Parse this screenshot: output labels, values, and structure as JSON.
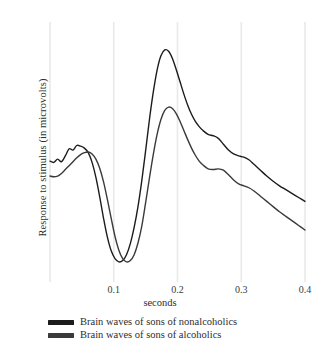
{
  "chart_data": {
    "type": "line",
    "title": "",
    "subtitle": "",
    "xlabel": "seconds",
    "ylabel": "Response to stimulus (in microvolts)",
    "xlim": [
      0.0,
      0.4
    ],
    "ylim": [
      -6,
      14
    ],
    "xticks": [
      0.1,
      0.2,
      0.3,
      0.4
    ],
    "xtick_labels": [
      "0.1",
      "0.2",
      "0.3",
      "0.4"
    ],
    "yticks": [],
    "ytick_labels": [],
    "grid": "vertical-only",
    "grid_color": "#e9e9e9",
    "legend_position": "below-plot-left",
    "annotations": [],
    "series": [
      {
        "name": "Brain waves of sons of nonalcoholics",
        "color": "#1c1c1c",
        "linewidth": 1.4,
        "x": [
          0.0,
          0.006,
          0.012,
          0.018,
          0.024,
          0.03,
          0.036,
          0.042,
          0.048,
          0.054,
          0.06,
          0.066,
          0.072,
          0.078,
          0.084,
          0.09,
          0.096,
          0.102,
          0.108,
          0.114,
          0.12,
          0.126,
          0.132,
          0.138,
          0.144,
          0.15,
          0.156,
          0.162,
          0.168,
          0.174,
          0.18,
          0.186,
          0.192,
          0.198,
          0.204,
          0.21,
          0.216,
          0.222,
          0.228,
          0.234,
          0.24,
          0.248,
          0.256,
          0.264,
          0.272,
          0.28,
          0.288,
          0.296,
          0.304,
          0.312,
          0.32,
          0.33,
          0.34,
          0.35,
          0.36,
          0.37,
          0.38,
          0.39,
          0.4
        ],
        "y": [
          3.3,
          3.2,
          3.45,
          3.25,
          3.7,
          4.25,
          4.15,
          4.5,
          4.45,
          4.3,
          3.95,
          3.2,
          2.05,
          0.55,
          -1.1,
          -2.55,
          -3.6,
          -4.2,
          -4.45,
          -4.35,
          -3.9,
          -3.05,
          -1.8,
          -0.2,
          1.8,
          4.1,
          6.5,
          8.6,
          10.3,
          11.4,
          11.85,
          11.75,
          11.2,
          10.35,
          9.4,
          8.45,
          7.6,
          6.9,
          6.35,
          5.95,
          5.65,
          5.35,
          5.25,
          5.05,
          4.6,
          4.15,
          3.85,
          3.7,
          3.6,
          3.4,
          3.05,
          2.6,
          2.15,
          1.75,
          1.4,
          1.1,
          0.8,
          0.5,
          0.2
        ]
      },
      {
        "name": "Brain waves of sons of alcoholics",
        "color": "#3a3a3a",
        "linewidth": 1.4,
        "x": [
          0.0,
          0.006,
          0.012,
          0.018,
          0.024,
          0.03,
          0.036,
          0.042,
          0.048,
          0.054,
          0.06,
          0.066,
          0.072,
          0.078,
          0.084,
          0.09,
          0.096,
          0.102,
          0.108,
          0.114,
          0.12,
          0.126,
          0.132,
          0.138,
          0.144,
          0.15,
          0.156,
          0.162,
          0.168,
          0.174,
          0.18,
          0.186,
          0.192,
          0.198,
          0.204,
          0.21,
          0.216,
          0.222,
          0.228,
          0.234,
          0.24,
          0.248,
          0.256,
          0.264,
          0.272,
          0.28,
          0.288,
          0.296,
          0.304,
          0.312,
          0.32,
          0.33,
          0.34,
          0.35,
          0.36,
          0.37,
          0.38,
          0.39,
          0.4
        ],
        "y": [
          2.15,
          2.1,
          2.15,
          2.35,
          2.65,
          2.95,
          3.25,
          3.55,
          3.8,
          3.95,
          4.0,
          3.85,
          3.45,
          2.75,
          1.7,
          0.35,
          -1.1,
          -2.5,
          -3.55,
          -4.2,
          -4.45,
          -4.35,
          -3.9,
          -3.0,
          -1.7,
          0.1,
          2.0,
          3.8,
          5.35,
          6.5,
          7.2,
          7.45,
          7.35,
          6.95,
          6.35,
          5.65,
          4.95,
          4.3,
          3.75,
          3.3,
          3.0,
          2.7,
          2.65,
          2.7,
          2.6,
          2.25,
          1.85,
          1.55,
          1.4,
          1.25,
          1.0,
          0.6,
          0.2,
          -0.2,
          -0.6,
          -0.95,
          -1.3,
          -1.65,
          -2.0
        ]
      }
    ]
  },
  "legend": {
    "items": [
      {
        "label": "Brain waves of sons of nonalcoholics",
        "color": "#1c1c1c"
      },
      {
        "label": "Brain waves of sons of alcoholics",
        "color": "#3a3a3a"
      }
    ]
  }
}
